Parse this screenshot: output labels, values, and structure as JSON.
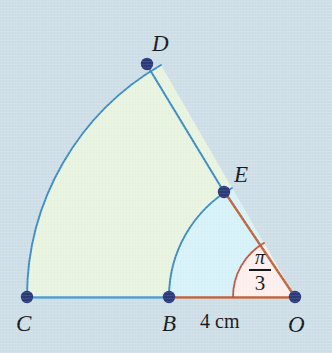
{
  "figure": {
    "background_color": "#cfdfe8",
    "colors": {
      "outer_sector_fill": "#e8f4e0",
      "inner_sector_fill": "#d8f2fa",
      "angle_sector_fill": "#fdf0ee",
      "blue_stroke": "#3c8cc4",
      "orange_stroke": "#c0663d",
      "angle_arc_stroke": "#c0563d",
      "vertex_dot": "#2b3a7a",
      "label_text": "#16181c"
    },
    "points": [
      {
        "id": "O",
        "label": "O",
        "x": 295,
        "y": 297,
        "label_x": 288,
        "label_y": 313
      },
      {
        "id": "B",
        "label": "B",
        "x": 169,
        "y": 297,
        "label_x": 162,
        "label_y": 312
      },
      {
        "id": "C",
        "label": "C",
        "x": 27,
        "y": 298,
        "label_x": 16,
        "label_y": 312
      },
      {
        "id": "D",
        "label": "D",
        "x": 147,
        "y": 64,
        "label_x": 152,
        "label_y": 32
      },
      {
        "id": "E",
        "label": "E",
        "x": 224,
        "y": 192,
        "label_x": 234,
        "label_y": 163
      }
    ],
    "segments": [
      {
        "id": "OB",
        "from": "O",
        "to": "B",
        "color": "orange",
        "note": "radius of inner sector along baseline, labelled 4 cm"
      },
      {
        "id": "BC",
        "from": "B",
        "to": "C",
        "color": "blue",
        "note": "outer baseline extension from B to C"
      },
      {
        "id": "OE",
        "from": "O",
        "to": "E",
        "color": "orange",
        "note": "inner sector radius at angle pi/3"
      },
      {
        "id": "ED",
        "from": "E",
        "to": "D",
        "color": "blue",
        "note": "outer sector radius continuation from E to D"
      }
    ],
    "arcs": [
      {
        "id": "arc_BE",
        "center": "O",
        "radius": 126,
        "from_deg": 0,
        "to_deg": 60,
        "color": "blue",
        "note": "inner arc from B to E"
      },
      {
        "id": "arc_CD",
        "center": "O",
        "radius": 268,
        "from_deg": 0,
        "to_deg": 60,
        "color": "blue",
        "note": "outer arc from C to D"
      },
      {
        "id": "arc_angle",
        "center": "O",
        "radius": 62,
        "from_deg": 0,
        "to_deg": 60,
        "color": "angle",
        "note": "angle marker arc at O"
      }
    ],
    "angle": {
      "vertex": "O",
      "numerator": "π",
      "denominator": "3",
      "value_radians": "π/3",
      "value_degrees": 60
    },
    "measurements": [
      {
        "id": "OB_length",
        "text": "4 cm",
        "label_x": 200,
        "label_y": 311,
        "between": "B and O"
      }
    ]
  }
}
